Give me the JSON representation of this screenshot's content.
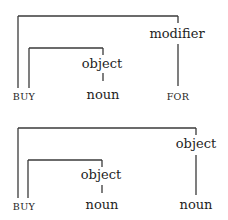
{
  "diagrams": [
    {
      "head": "BUY",
      "inner": {
        "role": "object",
        "dependent": "noun"
      },
      "outer": {
        "role": "modifier",
        "dependent": "FOR"
      }
    },
    {
      "head": "BUY",
      "inner": {
        "role": "object",
        "dependent": "noun"
      },
      "outer": {
        "role": "object",
        "dependent": "noun"
      }
    }
  ],
  "colors": {
    "line": "#3a3a3a",
    "text": "#1e1e1e",
    "background": "#ffffff"
  }
}
